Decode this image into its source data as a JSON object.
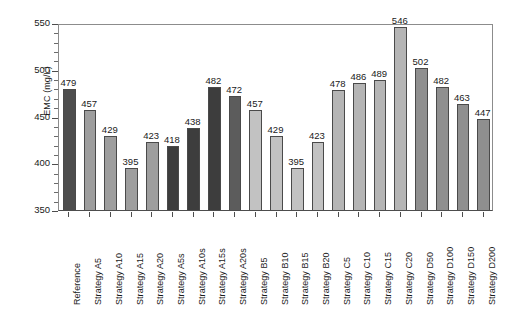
{
  "chart_data": {
    "type": "bar",
    "title": "",
    "xlabel": "",
    "ylabel": "EMC (mg/L)",
    "ylim": [
      350,
      550
    ],
    "ytick_step": 50,
    "yticks": [
      350,
      400,
      450,
      500,
      550
    ],
    "yminor_step": 10,
    "grid": false,
    "legend": "none",
    "categories": [
      "Reference",
      "Strategy A5",
      "Strategy  A10",
      "Strategy  A15",
      "Strategy A20",
      "Strategy A5s",
      "Strategy A10s",
      "Strategy  A15s",
      "Strategy A20s",
      "Strategy B5",
      "Strategy B10",
      "Strategy B15",
      "Strategy B20",
      "Strategy C5",
      "Strategy C10",
      "Strategy C15",
      "Strategy C20",
      "Strategy D50",
      "Strategy D100",
      "Strategy D150",
      "Strategy D200"
    ],
    "values": [
      479,
      457,
      429,
      395,
      423,
      418,
      438,
      482,
      472,
      457,
      429,
      395,
      423,
      478,
      486,
      489,
      546,
      502,
      482,
      463,
      447
    ],
    "bar_colors": [
      "#4d4d4d",
      "#9e9e9e",
      "#9e9e9e",
      "#9e9e9e",
      "#9e9e9e",
      "#3d3d3d",
      "#3d3d3d",
      "#3d3d3d",
      "#5c5c5c",
      "#c2c2c2",
      "#c2c2c2",
      "#c2c2c2",
      "#c2c2c2",
      "#b5b5b5",
      "#b5b5b5",
      "#b5b5b5",
      "#b5b5b5",
      "#8f8f8f",
      "#8f8f8f",
      "#8f8f8f",
      "#8f8f8f"
    ]
  },
  "axis": {
    "y_title": "EMC (mg/L)",
    "y_tick_labels": [
      "550",
      "500",
      "450",
      "400",
      "350"
    ]
  }
}
